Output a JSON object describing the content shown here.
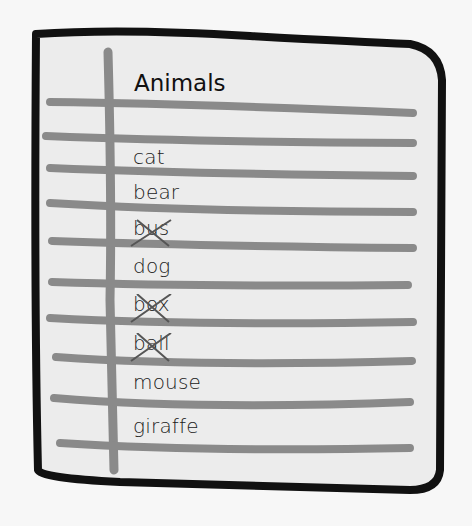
{
  "list": {
    "title": "Animals",
    "items": [
      {
        "label": "cat",
        "crossed": false
      },
      {
        "label": "bear",
        "crossed": false
      },
      {
        "label": "bus",
        "crossed": true
      },
      {
        "label": "dog",
        "crossed": false
      },
      {
        "label": "box",
        "crossed": true
      },
      {
        "label": "ball",
        "crossed": true
      },
      {
        "label": "mouse",
        "crossed": false
      },
      {
        "label": "giraffe",
        "crossed": false
      }
    ]
  },
  "colors": {
    "paper": "#ececec",
    "border": "#111111",
    "lines": "#8a8a8a",
    "background": "#f7f7f7"
  }
}
